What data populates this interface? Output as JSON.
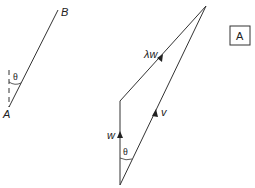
{
  "diagram": {
    "left_figure": {
      "point_a_label": "A",
      "point_b_label": "B",
      "angle_label": "θ"
    },
    "right_figure": {
      "vector_lambda_w_label": "λw",
      "vector_w_label": "w",
      "vector_v_label": "v",
      "angle_label": "θ"
    },
    "panel_label": "A",
    "colors": {
      "line": "#333333",
      "text": "#222222"
    }
  }
}
